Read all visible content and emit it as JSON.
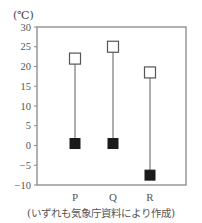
{
  "chart_data": {
    "type": "range-dot",
    "title": "",
    "unit_label": "(℃)",
    "xlabel": "",
    "ylabel": "(℃)",
    "ylim": [
      -10,
      30
    ],
    "yticks": [
      30,
      25,
      20,
      15,
      10,
      5,
      0,
      -5,
      -10
    ],
    "ytick_labels": [
      "30",
      "25",
      "20",
      "15",
      "10",
      "5",
      "0",
      "−5",
      "−10"
    ],
    "categories": [
      "P",
      "Q",
      "R"
    ],
    "series": [
      {
        "name": "high (open square)",
        "marker": "open-square",
        "values": [
          22,
          25,
          18.5
        ]
      },
      {
        "name": "low (filled square)",
        "marker": "filled-square",
        "values": [
          0.5,
          0.5,
          -7.5
        ]
      }
    ],
    "grid": false,
    "legend": "none",
    "caption": "(いずれも気象庁資料により作成)"
  },
  "unit_label": "(℃)",
  "caption": "(いずれも気象庁資料により作成)"
}
